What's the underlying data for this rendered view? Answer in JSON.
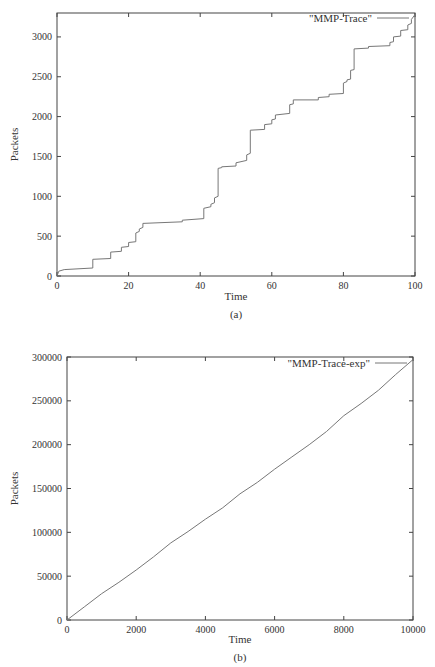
{
  "chart_data": [
    {
      "id": "a",
      "type": "line",
      "caption": "(a)",
      "title": "",
      "xlabel": "Time",
      "ylabel": "Packets",
      "xlim": [
        0,
        100
      ],
      "ylim": [
        0,
        3300
      ],
      "xticks": [
        "0",
        "20",
        "40",
        "60",
        "80",
        "100"
      ],
      "yticks": [
        "0",
        "500",
        "1000",
        "1500",
        "2000",
        "2500",
        "3000"
      ],
      "grid": false,
      "legend": {
        "position": "top-right",
        "entries": [
          "\"MMP-Trace\""
        ]
      },
      "series": [
        {
          "name": "\"MMP-Trace\"",
          "style": "step",
          "x": [
            0,
            0.5,
            2,
            10,
            10,
            15,
            15,
            18,
            18,
            20,
            20,
            22,
            22,
            23,
            23,
            24,
            24,
            35,
            35,
            41,
            41,
            43,
            43,
            44,
            44,
            45,
            45,
            46,
            46,
            50,
            50,
            53,
            53,
            54,
            54,
            58,
            58,
            60,
            60,
            61,
            61,
            65,
            65,
            66,
            66,
            73,
            73,
            76,
            76,
            80,
            80,
            81,
            81,
            82,
            82,
            83,
            83,
            87,
            87,
            93,
            93,
            94,
            94,
            96,
            96,
            98,
            98,
            99,
            99,
            100
          ],
          "y": [
            0,
            60,
            80,
            100,
            210,
            220,
            300,
            310,
            360,
            370,
            420,
            430,
            540,
            560,
            590,
            610,
            660,
            680,
            700,
            720,
            850,
            870,
            900,
            920,
            980,
            1000,
            1350,
            1360,
            1370,
            1380,
            1420,
            1450,
            1520,
            1540,
            1830,
            1840,
            1900,
            1910,
            1960,
            1970,
            2020,
            2040,
            2150,
            2160,
            2210,
            2210,
            2240,
            2250,
            2280,
            2290,
            2420,
            2440,
            2460,
            2470,
            2580,
            2590,
            2850,
            2860,
            2880,
            2890,
            2930,
            2940,
            3000,
            3010,
            3080,
            3090,
            3150,
            3170,
            3220,
            3280
          ]
        }
      ]
    },
    {
      "id": "b",
      "type": "line",
      "caption": "(b)",
      "title": "",
      "xlabel": "Time",
      "ylabel": "Packets",
      "xlim": [
        0,
        10000
      ],
      "ylim": [
        0,
        300000
      ],
      "xticks": [
        "0",
        "2000",
        "4000",
        "6000",
        "8000",
        "10000"
      ],
      "yticks": [
        "0",
        "50000",
        "100000",
        "150000",
        "200000",
        "250000",
        "300000"
      ],
      "grid": false,
      "legend": {
        "position": "top-right",
        "entries": [
          "\"MMP-Trace-exp\""
        ]
      },
      "series": [
        {
          "name": "\"MMP-Trace-exp\"",
          "style": "line",
          "x": [
            0,
            500,
            1000,
            1500,
            2000,
            2500,
            3000,
            3500,
            4000,
            4500,
            5000,
            5500,
            6000,
            6500,
            7000,
            7500,
            8000,
            8500,
            9000,
            9500,
            10000
          ],
          "y": [
            0,
            15000,
            30000,
            43000,
            57000,
            72000,
            88000,
            101000,
            115000,
            128000,
            144000,
            157000,
            172000,
            186000,
            200000,
            215000,
            233000,
            247000,
            262000,
            280000,
            297000
          ]
        }
      ]
    }
  ]
}
